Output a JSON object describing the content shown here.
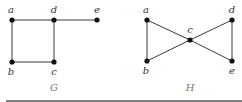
{
  "figure": {
    "graphs": [
      {
        "name": "G",
        "label": "G",
        "label_pos": [
          54,
          91
        ],
        "vertices": [
          {
            "id": "a",
            "label": "a",
            "x": 12,
            "y": 20,
            "lx": 11,
            "ly": 13
          },
          {
            "id": "d",
            "label": "d",
            "x": 54,
            "y": 20,
            "lx": 54,
            "ly": 13
          },
          {
            "id": "e",
            "label": "e",
            "x": 97,
            "y": 20,
            "lx": 97,
            "ly": 13
          },
          {
            "id": "b",
            "label": "b",
            "x": 12,
            "y": 62,
            "lx": 11,
            "ly": 75
          },
          {
            "id": "c",
            "label": "c",
            "x": 54,
            "y": 62,
            "lx": 54,
            "ly": 75
          }
        ],
        "edges": [
          [
            "a",
            "d"
          ],
          [
            "d",
            "e"
          ],
          [
            "a",
            "b"
          ],
          [
            "b",
            "c"
          ],
          [
            "d",
            "c"
          ]
        ]
      },
      {
        "name": "H",
        "label": "H",
        "label_pos": [
          190,
          91
        ],
        "vertices": [
          {
            "id": "a",
            "label": "a",
            "x": 147,
            "y": 20,
            "lx": 146,
            "ly": 13
          },
          {
            "id": "b",
            "label": "b",
            "x": 147,
            "y": 61,
            "lx": 146,
            "ly": 74
          },
          {
            "id": "c",
            "label": "c",
            "x": 190,
            "y": 40,
            "lx": 190,
            "ly": 33
          },
          {
            "id": "d",
            "label": "d",
            "x": 232,
            "y": 20,
            "lx": 232,
            "ly": 13
          },
          {
            "id": "e",
            "label": "e",
            "x": 232,
            "y": 61,
            "lx": 232,
            "ly": 74
          }
        ],
        "edges": [
          [
            "a",
            "b"
          ],
          [
            "a",
            "c"
          ],
          [
            "b",
            "c"
          ],
          [
            "c",
            "d"
          ],
          [
            "c",
            "e"
          ],
          [
            "d",
            "e"
          ]
        ]
      }
    ],
    "colors": {
      "edge": "#3a3a3a",
      "node": "#111111",
      "rule": "#555555"
    }
  }
}
